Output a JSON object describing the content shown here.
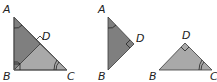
{
  "figure": {
    "colors": {
      "dark_fill": "#7f7f7f",
      "light_fill": "#a9a9a9",
      "stroke": "#3a3a3a",
      "mark": "#222222"
    },
    "triangles": [
      {
        "name": "triangle-ABC",
        "labels": {
          "A": "A",
          "B": "B",
          "C": "C",
          "D": "D"
        }
      },
      {
        "name": "triangle-ABD",
        "labels": {
          "A": "A",
          "B": "B",
          "D": "D"
        }
      },
      {
        "name": "triangle-BDC",
        "labels": {
          "B": "B",
          "C": "C",
          "D": "D"
        }
      }
    ]
  }
}
